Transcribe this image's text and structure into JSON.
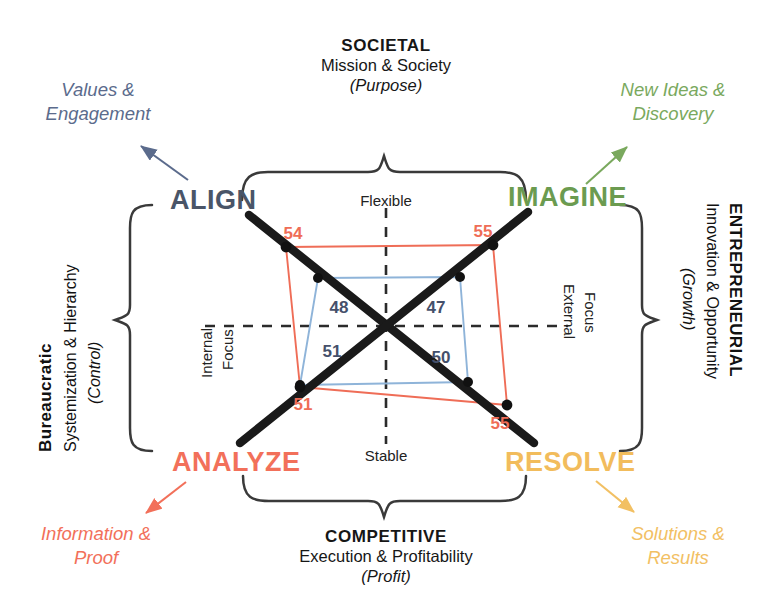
{
  "diagram": {
    "title_top": {
      "head": "SOCIETAL",
      "sub": "Mission & Society",
      "note": "(Purpose)"
    },
    "title_bottom": {
      "head": "COMPETITIVE",
      "sub": "Execution & Profitability",
      "note": "(Profit)"
    },
    "title_left": {
      "head": "Bureaucratic",
      "sub": "Systemization & Hierarchy",
      "note": "(Control)"
    },
    "title_right": {
      "head": "ENTREPRENEURIAL",
      "sub": "Innovation & Opportunity",
      "note": "(Growth)"
    },
    "quadrants": [
      {
        "key": "align",
        "label": "ALIGN",
        "callout": "Values &\nEngagement",
        "color": "#4a5568"
      },
      {
        "key": "imagine",
        "label": "IMAGINE",
        "callout": "New Ideas &\nDiscovery",
        "color": "#6b9b50"
      },
      {
        "key": "analyze",
        "label": "ANALYZE",
        "callout": "Information &\nProof",
        "color": "#f2705a"
      },
      {
        "key": "resolve",
        "label": "RESOLVE",
        "callout": "Solutions &\nResults",
        "color": "#f2bc5c"
      }
    ],
    "axis_labels": {
      "top": "Flexible",
      "bottom": "Stable",
      "left_line1": "Internal",
      "left_line2": "Focus",
      "right_line1": "External",
      "right_line2": "Focus"
    },
    "colors": {
      "outer_series": "#ef6d57",
      "inner_series": "#8fb4d9",
      "outer_value_text": "#ef6d57",
      "inner_value_text": "#45506b",
      "diagonal": "#1a1a1a",
      "dashed_axis": "#2b2b2b",
      "brace": "#3a3a3a"
    }
  },
  "chart_data": {
    "type": "radar",
    "axes": [
      "ALIGN",
      "IMAGINE",
      "RESOLVE",
      "ANALYZE"
    ],
    "axis_directions": [
      "upper-left",
      "upper-right",
      "lower-right",
      "lower-left"
    ],
    "series": [
      {
        "name": "outer",
        "color": "#ef6d57",
        "values": [
          54,
          55,
          55,
          51
        ],
        "labels": [
          "54",
          "55",
          "55",
          "51"
        ]
      },
      {
        "name": "inner",
        "color": "#8fb4d9",
        "values": [
          48,
          47,
          50,
          51
        ],
        "labels": [
          "48",
          "47",
          "50",
          "51"
        ]
      }
    ],
    "dimension_poles": {
      "vertical": [
        "Flexible",
        "Stable"
      ],
      "horizontal": [
        "Internal Focus",
        "External Focus"
      ]
    },
    "grid": false,
    "legend": "none"
  }
}
